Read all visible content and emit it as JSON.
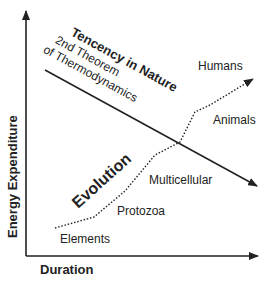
{
  "axes": {
    "y_label": "Energy Expenditure",
    "x_label": "Duration"
  },
  "tendency": {
    "title": "Tencency in Nature",
    "line1": "2nd Theorem",
    "line2": "of Thermodynamics"
  },
  "evolution": {
    "title": "Evolution",
    "stages": [
      "Elements",
      "Protozoa",
      "Multicellular",
      "Animals",
      "Humans"
    ]
  },
  "colors": {
    "ink": "#222222",
    "background": "#ffffff"
  }
}
